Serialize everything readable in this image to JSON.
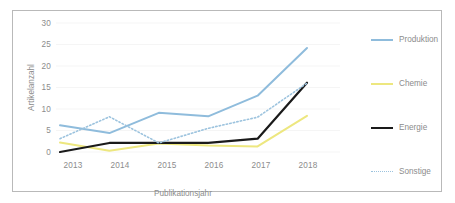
{
  "chart_data": {
    "type": "line",
    "title": "",
    "xlabel": "Publikationsjahr",
    "ylabel": "Artikelanzahl",
    "categories": [
      "2013",
      "2014",
      "2015",
      "2016",
      "2017",
      "2018"
    ],
    "x": [
      2013,
      2014,
      2015,
      2016,
      2017,
      2018
    ],
    "xlim": [
      2013,
      2018
    ],
    "ylim": [
      0,
      30
    ],
    "yticks": [
      0,
      5,
      10,
      15,
      20,
      25,
      30
    ],
    "grid": "horizontal-faint",
    "legend_position": "right",
    "series": [
      {
        "name": "Produktion",
        "color": "#8FBCDC",
        "style": "solid",
        "width": 2,
        "values": [
          6.2,
          4.4,
          9.1,
          8.3,
          13.1,
          24.2
        ]
      },
      {
        "name": "Chemie",
        "color": "#EDE77F",
        "style": "solid",
        "width": 2,
        "values": [
          2.2,
          0.3,
          2.0,
          1.5,
          1.3,
          8.4
        ]
      },
      {
        "name": "Energie",
        "color": "#1A1A1A",
        "style": "solid",
        "width": 2.2,
        "values": [
          0.0,
          2.1,
          2.1,
          2.1,
          3.1,
          16.1
        ]
      },
      {
        "name": "Sonstige",
        "color": "#9CC3DE",
        "style": "dotted",
        "width": 1.6,
        "values": [
          3.1,
          8.2,
          2.1,
          5.5,
          8.1,
          16.0
        ]
      }
    ]
  },
  "axis": {
    "ytick_labels": [
      "30",
      "25",
      "20",
      "15",
      "10",
      "5",
      "0"
    ],
    "xtick_labels": [
      "2013",
      "2014",
      "2015",
      "2016",
      "2017",
      "2018"
    ],
    "ylabel": "Artikelanzahl",
    "xlabel": "Publikationsjahr"
  },
  "legend": {
    "entries": [
      {
        "label": "Produktion",
        "color": "#8FBCDC",
        "style": "solid"
      },
      {
        "label": "Chemie",
        "color": "#EDE77F",
        "style": "solid"
      },
      {
        "label": "Energie",
        "color": "#1A1A1A",
        "style": "solid"
      },
      {
        "label": "Sonstige",
        "color": "#9CC3DE",
        "style": "dotted"
      }
    ]
  },
  "colors": {
    "border": "#b9b9b9",
    "text": "#8c8c8c",
    "grid": "#f2f2f2",
    "background": "#ffffff"
  }
}
